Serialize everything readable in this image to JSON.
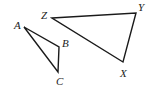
{
  "diagram": {
    "triangles": [
      {
        "name": "ABC",
        "vertices": [
          {
            "label": "A",
            "x": 24,
            "y": 27,
            "lx": 14,
            "ly": 28
          },
          {
            "label": "B",
            "x": 59,
            "y": 47,
            "lx": 62,
            "ly": 46
          },
          {
            "label": "C",
            "x": 58,
            "y": 72,
            "lx": 56,
            "ly": 85
          }
        ]
      },
      {
        "name": "ZYX",
        "vertices": [
          {
            "label": "Z",
            "x": 52,
            "y": 18,
            "lx": 41,
            "ly": 18
          },
          {
            "label": "Y",
            "x": 136,
            "y": 13,
            "lx": 138,
            "ly": 10
          },
          {
            "label": "X",
            "x": 123,
            "y": 62,
            "lx": 120,
            "ly": 76
          }
        ]
      }
    ],
    "stroke_color": "#1a1a1a",
    "background": "#ffffff"
  }
}
